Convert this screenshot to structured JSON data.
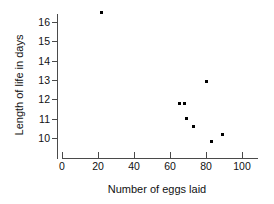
{
  "chart_data": {
    "type": "scatter",
    "title": "",
    "xlabel": "Number of eggs laid",
    "ylabel": "Length of life in days",
    "xlim": [
      0,
      109
    ],
    "ylim": [
      9.2,
      16.9
    ],
    "xticks": [
      0,
      20,
      40,
      60,
      80,
      100
    ],
    "yticks": [
      10,
      11,
      12,
      13,
      14,
      15,
      16
    ],
    "grid": false,
    "legend": null,
    "marker": "square",
    "marker_color": "#000000",
    "points": [
      {
        "x": 22,
        "y": 16.5
      },
      {
        "x": 65,
        "y": 11.8
      },
      {
        "x": 68,
        "y": 11.8
      },
      {
        "x": 69,
        "y": 11.0
      },
      {
        "x": 73,
        "y": 10.6
      },
      {
        "x": 80,
        "y": 12.9
      },
      {
        "x": 83,
        "y": 9.8
      },
      {
        "x": 89,
        "y": 10.2
      }
    ]
  },
  "axes": {
    "x_tick_labels": [
      "0",
      "20",
      "40",
      "60",
      "80",
      "100"
    ],
    "y_tick_labels": [
      "10",
      "11",
      "12",
      "13",
      "14",
      "15",
      "16"
    ],
    "x_title": "Number of eggs laid",
    "y_title": "Length of life in days"
  },
  "colors": {
    "axis": "#4a4a4a",
    "text": "#111111",
    "marker": "#000000",
    "background": "#ffffff"
  }
}
